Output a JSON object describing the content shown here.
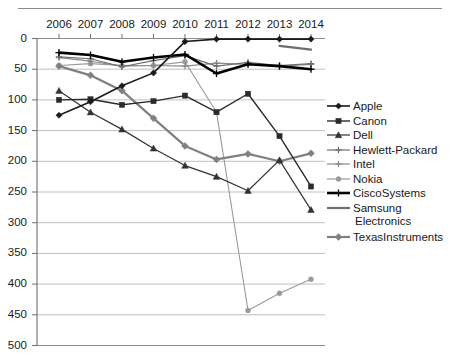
{
  "chart_data": {
    "type": "line",
    "title": "",
    "xlabel": "",
    "ylabel": "",
    "categories": [
      "2006",
      "2007",
      "2008",
      "2009",
      "2010",
      "2011",
      "2012",
      "2013",
      "2014"
    ],
    "ylim": [
      0,
      500
    ],
    "y_inverted": true,
    "y_ticks": [
      "0",
      "50",
      "100",
      "150",
      "200",
      "250",
      "300",
      "350",
      "400",
      "450",
      "500"
    ],
    "y_tick_step": 50,
    "grid": true,
    "legend_position": "right",
    "series": [
      {
        "name": "Apple",
        "marker": "diamond",
        "color": "#1a1a1a",
        "width": 1.6,
        "values": [
          125,
          103,
          77,
          56,
          5,
          1,
          1,
          1,
          1
        ]
      },
      {
        "name": "Canon",
        "marker": "square",
        "color": "#2b2b2b",
        "width": 1.4,
        "values": [
          100,
          99,
          108,
          102,
          93,
          120,
          90,
          159,
          241
        ]
      },
      {
        "name": "Dell",
        "marker": "triangle",
        "color": "#333333",
        "width": 1.2,
        "values": [
          85,
          120,
          148,
          179,
          207,
          225,
          248,
          198,
          279
        ]
      },
      {
        "name": "Hewlett-Packard",
        "marker": "plus",
        "color": "#6e6e6e",
        "width": 1.2,
        "values": [
          30,
          33,
          46,
          36,
          28,
          45,
          39,
          44,
          41
        ]
      },
      {
        "name": "Intel",
        "marker": "plus",
        "color": "#8a8a8a",
        "width": 1.2,
        "values": [
          31,
          37,
          45,
          44,
          45,
          40,
          42,
          45,
          42
        ]
      },
      {
        "name": "Nokia",
        "marker": "circle",
        "color": "#9a9a9a",
        "width": 1.1,
        "values": [
          44,
          41,
          44,
          44,
          38,
          120,
          443,
          415,
          392
        ]
      },
      {
        "name": "CiscoSystems",
        "marker": "plus",
        "color": "#000000",
        "width": 2.6,
        "values": [
          23,
          27,
          38,
          31,
          26,
          57,
          42,
          45,
          50
        ]
      },
      {
        "name": "Samsung Electronics",
        "marker": "none",
        "color": "#6e6e6e",
        "width": 2.2,
        "values": [
          null,
          null,
          null,
          null,
          null,
          null,
          null,
          12,
          18
        ]
      },
      {
        "name": "TexasInstruments",
        "marker": "diamond",
        "color": "#808080",
        "width": 2.2,
        "values": [
          45,
          60,
          85,
          130,
          175,
          197,
          188,
          200,
          187
        ]
      }
    ]
  },
  "legend": {
    "items": [
      {
        "label": "Apple"
      },
      {
        "label": "Canon"
      },
      {
        "label": "Dell"
      },
      {
        "label": "Hewlett-Packard"
      },
      {
        "label": "Intel"
      },
      {
        "label": "Nokia"
      },
      {
        "label": "CiscoSystems"
      },
      {
        "label": "Samsung"
      },
      {
        "label": "Electronics"
      },
      {
        "label": "TexasInstruments"
      }
    ]
  }
}
